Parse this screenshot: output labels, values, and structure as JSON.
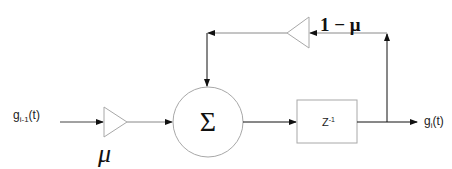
{
  "diagram": {
    "type": "block-diagram",
    "input": {
      "label_base": "g",
      "label_sub": "i-1",
      "label_suffix": "(t)"
    },
    "output": {
      "label_base": "g",
      "label_sub": "i",
      "label_suffix": "(t)"
    },
    "input_gain": {
      "label": "μ"
    },
    "feedback_gain": {
      "label": "1 − μ"
    },
    "summer": {
      "symbol": "Σ"
    },
    "delay": {
      "label_base": "Z",
      "label_sup": "-1"
    },
    "colors": {
      "line": "#1a1a1a",
      "shape_stroke": "#a8a8a8",
      "feedback_line": "#8a8a8a",
      "background": "#ffffff"
    }
  }
}
